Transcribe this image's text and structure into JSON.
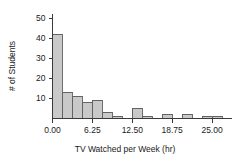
{
  "chart_data": {
    "type": "bar",
    "title": "",
    "subtitle": "",
    "xlabel": "TV Watched per Week (hr)",
    "ylabel": "# of Students",
    "grid": false,
    "legend": "none",
    "bin_width": 1.5625,
    "xlim": [
      0,
      28.125
    ],
    "ylim": [
      0,
      52
    ],
    "xtick_labels": [
      "0.00",
      "6.25",
      "12.50",
      "18.75",
      "25.00"
    ],
    "xtick_values": [
      0,
      6.25,
      12.5,
      18.75,
      25
    ],
    "ytick_labels": [
      "10",
      "20",
      "30",
      "40",
      "50"
    ],
    "ytick_values": [
      10,
      20,
      30,
      40,
      50
    ],
    "bins": [
      {
        "x0": 0.0,
        "x1": 1.5625,
        "count": 42
      },
      {
        "x0": 1.5625,
        "x1": 3.125,
        "count": 13
      },
      {
        "x0": 3.125,
        "x1": 4.6875,
        "count": 11
      },
      {
        "x0": 4.6875,
        "x1": 6.25,
        "count": 8
      },
      {
        "x0": 6.25,
        "x1": 7.8125,
        "count": 9
      },
      {
        "x0": 7.8125,
        "x1": 9.375,
        "count": 3
      },
      {
        "x0": 9.375,
        "x1": 10.9375,
        "count": 1
      },
      {
        "x0": 10.9375,
        "x1": 12.5,
        "count": 0
      },
      {
        "x0": 12.5,
        "x1": 14.0625,
        "count": 5
      },
      {
        "x0": 14.0625,
        "x1": 15.625,
        "count": 1
      },
      {
        "x0": 15.625,
        "x1": 17.1875,
        "count": 0
      },
      {
        "x0": 17.1875,
        "x1": 18.75,
        "count": 2
      },
      {
        "x0": 18.75,
        "x1": 20.3125,
        "count": 0
      },
      {
        "x0": 20.3125,
        "x1": 21.875,
        "count": 2
      },
      {
        "x0": 21.875,
        "x1": 23.4375,
        "count": 0
      },
      {
        "x0": 23.4375,
        "x1": 25.0,
        "count": 1
      },
      {
        "x0": 25.0,
        "x1": 26.5625,
        "count": 1
      }
    ],
    "categories": [
      "0.00-1.56",
      "1.56-3.13",
      "3.13-4.69",
      "4.69-6.25",
      "6.25-7.81",
      "7.81-9.38",
      "9.38-10.94",
      "10.94-12.50",
      "12.50-14.06",
      "14.06-15.63",
      "15.63-17.19",
      "17.19-18.75",
      "18.75-20.31",
      "20.31-21.88",
      "21.88-23.44",
      "23.44-25.00",
      "25.00-26.56"
    ],
    "values": [
      42,
      13,
      11,
      8,
      9,
      3,
      1,
      0,
      5,
      1,
      0,
      2,
      0,
      2,
      0,
      1,
      1
    ],
    "colors": {
      "bar_fill": "#c9c9c9",
      "bar_stroke": "#4a4a4a",
      "axis": "#3a3a3a",
      "text": "#1a1a1a",
      "background": "#ffffff"
    }
  }
}
